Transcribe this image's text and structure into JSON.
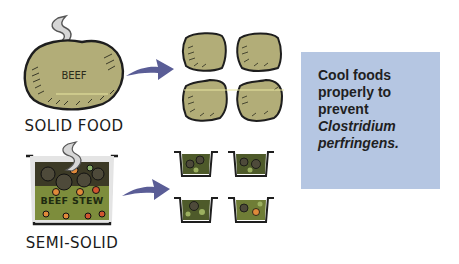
{
  "solid": {
    "food_label": "BEEF",
    "caption": "SOLID FOOD",
    "portions": 4
  },
  "semisolid": {
    "food_label": "BEEF STEW",
    "caption": "SEMI-SOLID",
    "portions": 4
  },
  "note": {
    "line1": "Cool foods",
    "line2": "properly to",
    "line3": "prevent",
    "line4": "Clostridium",
    "line5": "perfringens."
  },
  "colors": {
    "beef": "#b2ad78",
    "outline": "#1e1e1e",
    "arrow": "#5a5d96",
    "steam": "#d8d8d8",
    "note_bg": "#b5c6e2",
    "stew_broth": "#7a8a3a",
    "pot": "#e6e6e6"
  }
}
